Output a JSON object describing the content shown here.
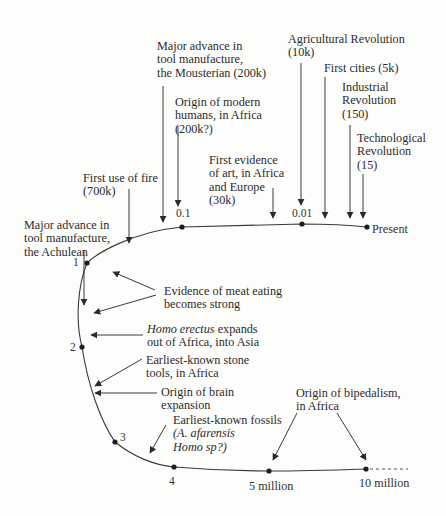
{
  "diagram": {
    "title": "",
    "timeline_ticks": {
      "t_01": "0.1",
      "t_001": "0.01",
      "present": "Present",
      "t1": "1",
      "t2": "2",
      "t3": "3",
      "t4": "4",
      "t5m": "5 million",
      "t10m": "10 million"
    },
    "events": {
      "mousterian": [
        "Major advance in",
        "tool manufacture,",
        "the Mousterian (200k)"
      ],
      "modern_humans": [
        "Origin of modern",
        "humans, in Africa",
        "(200k?)"
      ],
      "agricultural": [
        "Agricultural Revolution",
        "(10k)"
      ],
      "cities": [
        "First cities (5k)"
      ],
      "industrial": [
        "Industrial",
        "Revolution",
        "(150)"
      ],
      "technological": [
        "Technological",
        "Revolution",
        "(15)"
      ],
      "art": [
        "First evidence",
        "of art, in Africa",
        "and Europe",
        "(30k)"
      ],
      "fire": [
        "First use of fire",
        "(700k)"
      ],
      "achulean": [
        "Major advance in",
        "tool manufacture,",
        "the Achulean"
      ],
      "meat": [
        "Evidence of meat eating",
        "becomes strong"
      ],
      "erectus_italic": "Homo erectus",
      "erectus": [
        " expands",
        "out of Africa, into Asia"
      ],
      "stone_tools": [
        "Earliest-known stone",
        "tools, in Africa"
      ],
      "brain": [
        "Origin of brain",
        "expansion"
      ],
      "fossils": [
        "Earliest-known fossils",
        "(A. afarensis",
        "Homo sp?)"
      ],
      "bipedalism": [
        "Origin of bipedalism,",
        "in Africa"
      ]
    },
    "colors": {
      "line": "#3a3a3a",
      "text": "#2b2b2b",
      "background": "#fdfdfc"
    }
  }
}
